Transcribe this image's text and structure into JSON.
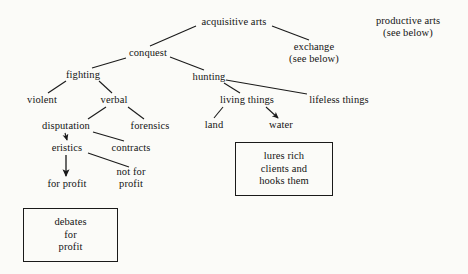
{
  "diagram": {
    "background_color": "#fbfbf8",
    "line_color": "#1a1a1a",
    "text_color": "#141414",
    "nodes": {
      "acquisitive_arts": "acquisitive arts",
      "conquest": "conquest",
      "exchange": "exchange\n(see below)",
      "productive_arts": "productive arts\n(see below)",
      "fighting": "fighting",
      "hunting": "hunting",
      "violent": "violent",
      "verbal": "verbal",
      "living_things": "living things",
      "lifeless_things": "lifeless things",
      "land": "land",
      "water": "water",
      "disputation": "disputation",
      "forensics": "forensics",
      "eristics": "eristics",
      "contracts": "contracts",
      "for_profit": "for profit",
      "not_for_profit": "not for\nprofit"
    },
    "boxes": {
      "debates_for_profit": "debates\nfor\nprofit",
      "lures_rich_clients": "lures rich\nclients and\nhooks them"
    },
    "edges": [
      {
        "from": "acquisitive arts",
        "to": "conquest"
      },
      {
        "from": "acquisitive arts",
        "to": "exchange"
      },
      {
        "from": "conquest",
        "to": "fighting"
      },
      {
        "from": "conquest",
        "to": "hunting"
      },
      {
        "from": "fighting",
        "to": "violent"
      },
      {
        "from": "fighting",
        "to": "verbal"
      },
      {
        "from": "hunting",
        "to": "living things"
      },
      {
        "from": "hunting",
        "to": "lifeless things"
      },
      {
        "from": "living things",
        "to": "land"
      },
      {
        "from": "living things",
        "to": "water",
        "arrow": true
      },
      {
        "from": "verbal",
        "to": "disputation"
      },
      {
        "from": "verbal",
        "to": "forensics"
      },
      {
        "from": "disputation",
        "to": "eristics",
        "arrow": true
      },
      {
        "from": "disputation",
        "to": "contracts"
      },
      {
        "from": "eristics",
        "to": "for profit",
        "arrow": true
      },
      {
        "from": "eristics",
        "to": "not for profit"
      }
    ]
  }
}
